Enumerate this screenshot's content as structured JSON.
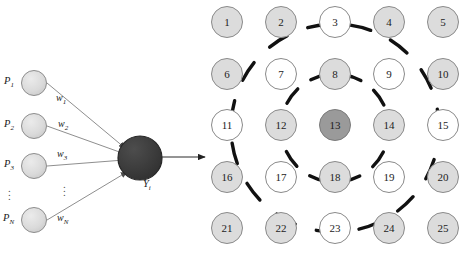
{
  "figure": {
    "left_diagram": {
      "name": "artificial-neuron-model",
      "inputs": [
        {
          "label": "P",
          "subscript": "1"
        },
        {
          "label": "P",
          "subscript": "2"
        },
        {
          "label": "P",
          "subscript": "3"
        },
        {
          "label": "P",
          "subscript": "N"
        }
      ],
      "weights": [
        {
          "label": "w",
          "subscript": "1"
        },
        {
          "label": "w",
          "subscript": "2"
        },
        {
          "label": "w",
          "subscript": "3"
        },
        {
          "label": "w",
          "subscript": "N"
        }
      ],
      "output": {
        "label": "Y",
        "subscript": "i"
      },
      "ellipsis": "⋮",
      "colors": {
        "input_node_fill": "#dcdcdc",
        "input_node_stroke": "#8a8a8a",
        "output_node_fill": "#3a3a3a",
        "output_node_stroke": "#2a2a2a",
        "edge": "#6b6b6b"
      }
    },
    "right_diagram": {
      "name": "numbered-grid-with-concentric-rings",
      "rows": 5,
      "cols": 5,
      "cells": [
        {
          "n": "1",
          "fill": "gray"
        },
        {
          "n": "2",
          "fill": "gray"
        },
        {
          "n": "3",
          "fill": "white"
        },
        {
          "n": "4",
          "fill": "gray"
        },
        {
          "n": "5",
          "fill": "gray"
        },
        {
          "n": "6",
          "fill": "gray"
        },
        {
          "n": "7",
          "fill": "white"
        },
        {
          "n": "8",
          "fill": "gray"
        },
        {
          "n": "9",
          "fill": "white"
        },
        {
          "n": "10",
          "fill": "gray"
        },
        {
          "n": "11",
          "fill": "white"
        },
        {
          "n": "12",
          "fill": "gray"
        },
        {
          "n": "13",
          "fill": "dark"
        },
        {
          "n": "14",
          "fill": "gray"
        },
        {
          "n": "15",
          "fill": "white"
        },
        {
          "n": "16",
          "fill": "gray"
        },
        {
          "n": "17",
          "fill": "white"
        },
        {
          "n": "18",
          "fill": "gray"
        },
        {
          "n": "19",
          "fill": "white"
        },
        {
          "n": "20",
          "fill": "gray"
        },
        {
          "n": "21",
          "fill": "gray"
        },
        {
          "n": "22",
          "fill": "gray"
        },
        {
          "n": "23",
          "fill": "white"
        },
        {
          "n": "24",
          "fill": "gray"
        },
        {
          "n": "25",
          "fill": "gray"
        }
      ],
      "rings": [
        {
          "name": "inner-dashed-ring",
          "radius_px": 54
        },
        {
          "name": "outer-dashed-ring",
          "radius_px": 104
        }
      ],
      "center_cell": "13",
      "colors": {
        "cell_gray": "#dcdcdc",
        "cell_white": "#ffffff",
        "cell_dark": "#9a9a9a",
        "cell_stroke": "#8a8a8a",
        "ring_stroke": "#111111"
      }
    },
    "caption": ""
  }
}
